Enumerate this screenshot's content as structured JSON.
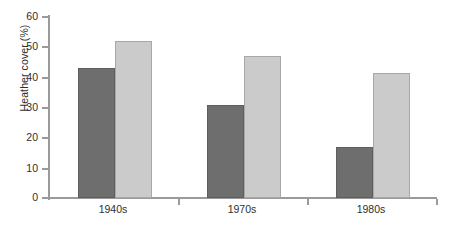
{
  "chart_data": {
    "type": "bar",
    "title": "",
    "xlabel": "",
    "ylabel": "Heather cover (%)",
    "categories": [
      "1940s",
      "1970s",
      "1980s"
    ],
    "series": [
      {
        "name": "series-1",
        "color": "#6e6e6e",
        "values": [
          43,
          31,
          17
        ]
      },
      {
        "name": "series-2",
        "color": "#cbcbcb",
        "values": [
          52,
          47,
          41.5
        ]
      }
    ],
    "ylim": [
      0,
      60
    ],
    "yticks": [
      0,
      10,
      20,
      30,
      40,
      50,
      60
    ],
    "ytick_labels": [
      "0",
      "10",
      "20",
      "30",
      "40",
      "50",
      "60"
    ],
    "grid": false,
    "legend": "none",
    "axis_color": "#9a9a9a"
  },
  "axis": {
    "y_title": "Heather cover (%)",
    "ticks": {
      "t60": "60",
      "t50": "50",
      "t40": "40",
      "t30": "30",
      "t20": "20",
      "t10": "10",
      "t0": "0"
    },
    "categories": {
      "c0": "1940s",
      "c1": "1970s",
      "c2": "1980s"
    }
  }
}
